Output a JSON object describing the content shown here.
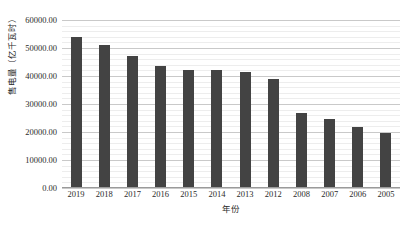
{
  "chart_data": {
    "type": "bar",
    "title": "",
    "xlabel": "年份",
    "ylabel": "售电量（亿千瓦时）",
    "categories": [
      "2019",
      "2018",
      "2017",
      "2016",
      "2015",
      "2014",
      "2013",
      "2012",
      "2008",
      "2007",
      "2006",
      "2005"
    ],
    "values": [
      54000,
      51000,
      47000,
      43500,
      42000,
      42000,
      41500,
      38800,
      26800,
      24500,
      21800,
      19500
    ],
    "series": [
      {
        "name": "售电量",
        "values": [
          54000,
          51000,
          47000,
          43500,
          42000,
          42000,
          41500,
          38800,
          26800,
          24500,
          21800,
          19500
        ]
      }
    ],
    "ylim": [
      0,
      60000
    ],
    "ytick_values": [
      0,
      10000,
      20000,
      30000,
      40000,
      50000,
      60000
    ],
    "ytick_labels": [
      "0.00",
      "10000.00",
      "20000.00",
      "30000.00",
      "40000.00",
      "50000.00",
      "60000.00"
    ],
    "minor_gridline_step": 2000,
    "grid": true,
    "legend": "none",
    "bar_color": "#434343",
    "major_gridline_color": "#c9c9c9",
    "minor_gridline_color": "#ededed",
    "background_color": "#ffffff",
    "text_color": "#2b2b2b"
  }
}
